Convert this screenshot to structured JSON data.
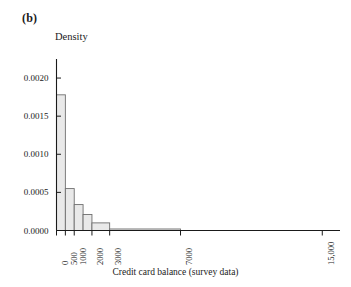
{
  "panel": {
    "label": "(b)"
  },
  "chart_data": {
    "type": "bar",
    "subtype": "histogram",
    "title": "",
    "xlabel": "Credit card balance (survey data)",
    "ylabel": "Density",
    "xlim": [
      0,
      16000
    ],
    "ylim": [
      0.0,
      0.00225
    ],
    "grid": false,
    "legend": "none",
    "xticks": [
      0,
      500,
      1000,
      2000,
      3000,
      7000,
      15000
    ],
    "xtick_labels": [
      "0",
      "500",
      "1000",
      "2000",
      "3000",
      "7000",
      "15,000"
    ],
    "yticks": [
      0.0,
      0.0005,
      0.001,
      0.0015,
      0.002
    ],
    "ytick_labels": [
      "0.0000",
      "0.0005",
      "0.0010",
      "0.0015",
      "0.0020"
    ],
    "bin_edges": [
      0,
      500,
      1000,
      1500,
      2000,
      3000,
      7000
    ],
    "densities": [
      0.00178,
      0.00055,
      0.00034,
      0.00021,
      0.0001,
      2e-05
    ],
    "bars": [
      {
        "x0": 0,
        "x1": 500,
        "density": 0.00178
      },
      {
        "x0": 500,
        "x1": 1000,
        "density": 0.00055
      },
      {
        "x0": 1000,
        "x1": 1500,
        "density": 0.00034
      },
      {
        "x0": 1500,
        "x1": 2000,
        "density": 0.00021
      },
      {
        "x0": 2000,
        "x1": 3000,
        "density": 0.0001
      },
      {
        "x0": 3000,
        "x1": 7000,
        "density": 2e-05
      }
    ],
    "colors": {
      "bar_fill": "#e9e9e9",
      "bar_stroke": "#6e6e6e",
      "axis": "#1a1a1a",
      "text": "#1a1a1a"
    }
  }
}
